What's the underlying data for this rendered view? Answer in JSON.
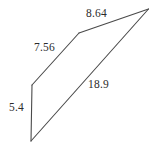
{
  "figure": {
    "kind": "geometry-diagram",
    "shape": "quadrilateral",
    "background_color": "#ffffff",
    "stroke_color": "#4a4a4a",
    "label_color": "#2b2b2b",
    "stroke_width": 1.1,
    "vertices": [
      {
        "name": "apex-right",
        "x": 148.5,
        "y": 9.0
      },
      {
        "name": "bend-top",
        "x": 79.0,
        "y": 33.0
      },
      {
        "name": "upper-left",
        "x": 32.0,
        "y": 85.0
      },
      {
        "name": "lower-left",
        "x": 31.0,
        "y": 141.0
      }
    ],
    "edges": [
      {
        "name": "edge-top",
        "from": "bend-top",
        "to": "apex-right",
        "label": "8.64"
      },
      {
        "name": "edge-upper-left",
        "from": "upper-left",
        "to": "bend-top",
        "label": "7.56"
      },
      {
        "name": "edge-vertical",
        "from": "upper-left",
        "to": "lower-left",
        "label": "5.4"
      },
      {
        "name": "edge-diagonal",
        "from": "lower-left",
        "to": "apex-right",
        "label": "18.9"
      }
    ]
  },
  "labels": {
    "top": "8.64",
    "upper_left": "7.56",
    "vertical": "5.4",
    "diagonal": "18.9"
  }
}
